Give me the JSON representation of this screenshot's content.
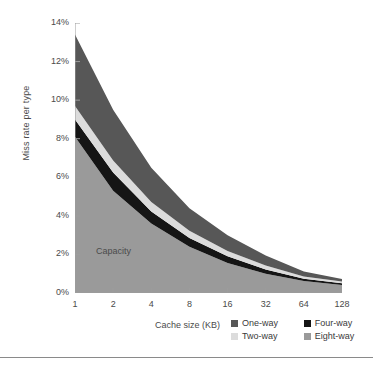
{
  "chart_data": {
    "type": "area",
    "title": "",
    "xlabel": "Cache size (KB)",
    "ylabel": "Miss rate per type",
    "stacked": true,
    "grid": false,
    "legend_position": "bottom-right",
    "annotations": [
      {
        "text": "Capacity",
        "x": 1.8,
        "y": 2.0
      }
    ],
    "x": [
      1,
      2,
      4,
      8,
      16,
      32,
      64,
      128
    ],
    "xtick_labels": [
      "1",
      "2",
      "4",
      "8",
      "16",
      "32",
      "64",
      "128"
    ],
    "xscale": "log2",
    "ylim": [
      0,
      14
    ],
    "ytick_labels": [
      "0%",
      "2%",
      "4%",
      "6%",
      "8%",
      "10%",
      "12%",
      "14%"
    ],
    "ytick_values": [
      0,
      2,
      4,
      6,
      8,
      10,
      12,
      14
    ],
    "series": [
      {
        "name": "Eight-way",
        "color": "#9a9a9a",
        "values": [
          8.1,
          5.3,
          3.6,
          2.4,
          1.55,
          1.0,
          0.62,
          0.42
        ]
      },
      {
        "name": "Four-way",
        "color": "#151515",
        "values": [
          0.9,
          0.95,
          0.62,
          0.45,
          0.35,
          0.22,
          0.12,
          0.09
        ]
      },
      {
        "name": "Two-way",
        "color": "#dcdcdc",
        "values": [
          0.7,
          0.62,
          0.5,
          0.38,
          0.28,
          0.2,
          0.11,
          0.08
        ]
      },
      {
        "name": "One-way",
        "color": "#575757",
        "values": [
          3.7,
          2.63,
          1.78,
          1.17,
          0.82,
          0.53,
          0.27,
          0.13
        ]
      }
    ],
    "cumulative_tops": {
      "eight_way": [
        8.1,
        5.3,
        3.6,
        2.4,
        1.55,
        1.0,
        0.62,
        0.42
      ],
      "four_way": [
        9.0,
        6.25,
        4.22,
        2.85,
        1.9,
        1.22,
        0.74,
        0.51
      ],
      "two_way": [
        9.7,
        6.87,
        4.72,
        3.23,
        2.18,
        1.42,
        0.85,
        0.59
      ],
      "one_way": [
        13.4,
        9.5,
        6.5,
        4.4,
        3.0,
        1.95,
        1.12,
        0.72
      ]
    }
  },
  "axes": {
    "y_title": "Miss rate per type",
    "x_title": "Cache size (KB)",
    "y_ticks": [
      "14%",
      "12%",
      "10%",
      "8%",
      "6%",
      "4%",
      "2%",
      "0%"
    ],
    "x_ticks": [
      "1",
      "2",
      "4",
      "8",
      "16",
      "32",
      "64",
      "128"
    ]
  },
  "annotation": {
    "capacity": "Capacity"
  },
  "legend": {
    "items": [
      {
        "label": "One-way",
        "color": "#575757"
      },
      {
        "label": "Four-way",
        "color": "#151515"
      },
      {
        "label": "Two-way",
        "color": "#dcdcdc"
      },
      {
        "label": "Eight-way",
        "color": "#9a9a9a"
      }
    ]
  },
  "colors": {
    "axis": "#9c9c9c",
    "text": "#4a4a4a",
    "rule": "#8a8a8a",
    "background": "#ffffff"
  }
}
